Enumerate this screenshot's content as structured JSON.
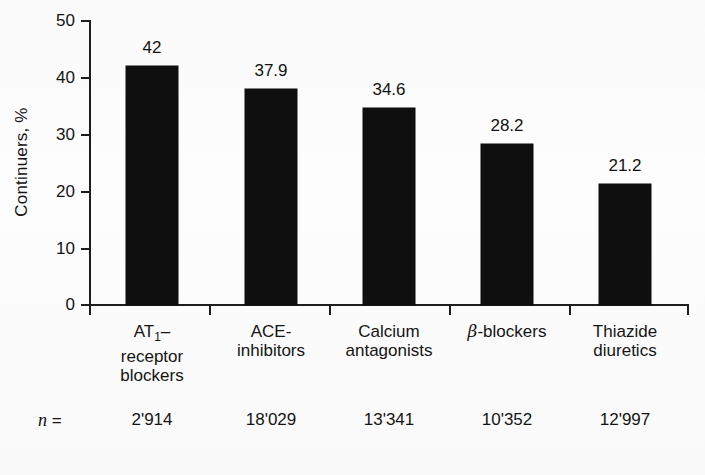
{
  "chart_data": {
    "type": "bar",
    "title": "",
    "subtitle": "",
    "xlabel": "",
    "ylabel": "Continuers, %",
    "ylim": [
      0,
      50
    ],
    "yticks": [
      0,
      10,
      20,
      30,
      40,
      50
    ],
    "ytick_labels": [
      "0",
      "10",
      "20",
      "30",
      "40",
      "50"
    ],
    "grid": false,
    "legend": "none",
    "bar_color": "#100f0f",
    "categories": [
      "AT1-receptor blockers",
      "ACE-inhibitors",
      "Calcium antagonists",
      "β-blockers",
      "Thiazide diuretics"
    ],
    "values": [
      42,
      37.9,
      34.6,
      28.2,
      21.2
    ],
    "value_labels": [
      "42",
      "37.9",
      "34.6",
      "28.2",
      "21.2"
    ],
    "annotations": {
      "n_label": "n =",
      "n_values": [
        "2'914",
        "18'029",
        "13'341",
        "10'352",
        "12'997"
      ]
    }
  },
  "axes": {
    "y_label": "Continuers, %",
    "y_ticks": [
      {
        "value": "50"
      },
      {
        "value": "40"
      },
      {
        "value": "30"
      },
      {
        "value": "20"
      },
      {
        "value": "10"
      },
      {
        "value": "0"
      }
    ]
  },
  "bars": [
    {
      "value_label": "42",
      "cat_line1_pre": "AT",
      "cat_line1_sub": "1",
      "cat_line1_post": "–",
      "cat_line2": "receptor",
      "cat_line3": "blockers",
      "n_value": "2'914"
    },
    {
      "value_label": "37.9",
      "cat_line1_pre": "ACE-",
      "cat_line1_sub": "",
      "cat_line1_post": "",
      "cat_line2": "inhibitors",
      "cat_line3": "",
      "n_value": "18'029"
    },
    {
      "value_label": "34.6",
      "cat_line1_pre": "Calcium",
      "cat_line1_sub": "",
      "cat_line1_post": "",
      "cat_line2": "antagonists",
      "cat_line3": "",
      "n_value": "13'341"
    },
    {
      "value_label": "28.2",
      "cat_line1_pre": "",
      "cat_line1_sub": "",
      "cat_line1_post": "-blockers",
      "cat_line2": "",
      "cat_line3": "",
      "cat_greek": "β",
      "n_value": "10'352"
    },
    {
      "value_label": "21.2",
      "cat_line1_pre": "Thiazide",
      "cat_line1_sub": "",
      "cat_line1_post": "",
      "cat_line2": "diuretics",
      "cat_line3": "",
      "n_value": "12'997"
    }
  ],
  "footer": {
    "n_prefix": "n",
    "n_equals": "="
  }
}
